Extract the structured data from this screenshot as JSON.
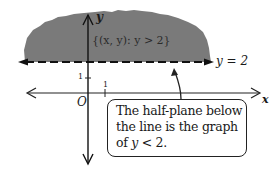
{
  "diagram": {
    "type": "half-plane graph",
    "shaded_region": {
      "label": "{(x, y): y > 2}",
      "fill_color": "#7a7a7a",
      "side": "above"
    },
    "boundary_line": {
      "equation_label": "y = 2",
      "style": "dashed",
      "y_value": 2
    },
    "axes": {
      "x_label": "x",
      "y_label": "y",
      "origin_label": "O",
      "x_tick_label": "1",
      "y_tick_label": "1"
    },
    "callout": {
      "lines": [
        "The half-plane below",
        "the line is the graph",
        "of y < 2."
      ],
      "line3_prefix": "of ",
      "line3_math": "y",
      "line3_suffix": " < 2."
    }
  }
}
